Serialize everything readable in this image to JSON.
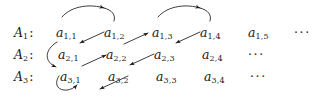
{
  "figure": {
    "ink_color": "#1a1a1a",
    "background_color": "#ffffff",
    "width": 325,
    "height": 100
  },
  "rows": [
    {
      "label_base": "A",
      "label_sub": "1",
      "label_punct": ":",
      "label_x": 14,
      "label_y": 27,
      "terms": [
        {
          "base": "a",
          "sub": "1,1",
          "x": 56,
          "y": 27
        },
        {
          "base": "a",
          "sub": "1,2",
          "x": 104,
          "y": 27
        },
        {
          "base": "a",
          "sub": "1,3",
          "x": 152,
          "y": 27
        },
        {
          "base": "a",
          "sub": "1,4",
          "x": 200,
          "y": 27
        },
        {
          "base": "a",
          "sub": "1,5",
          "x": 248,
          "y": 27
        }
      ],
      "ellipsis": {
        "text": "···",
        "x": 294,
        "y": 27
      }
    },
    {
      "label_base": "A",
      "label_sub": "2",
      "label_punct": ":",
      "label_x": 14,
      "label_y": 49,
      "terms": [
        {
          "base": "a",
          "sub": "2,1",
          "x": 58,
          "y": 49
        },
        {
          "base": "a",
          "sub": "2,2",
          "x": 106,
          "y": 49
        },
        {
          "base": "a",
          "sub": "2,3",
          "x": 154,
          "y": 49
        },
        {
          "base": "a",
          "sub": "2,4",
          "x": 202,
          "y": 49
        }
      ],
      "ellipsis": {
        "text": "···",
        "x": 248,
        "y": 49
      }
    },
    {
      "label_base": "A",
      "label_sub": "3",
      "label_punct": ":",
      "label_x": 14,
      "label_y": 71,
      "terms": [
        {
          "base": "a",
          "sub": "3,1",
          "x": 60,
          "y": 71
        },
        {
          "base": "a",
          "sub": "3,2",
          "x": 108,
          "y": 71
        },
        {
          "base": "a",
          "sub": "3,3",
          "x": 156,
          "y": 71
        },
        {
          "base": "a",
          "sub": "3,4",
          "x": 204,
          "y": 71
        }
      ],
      "ellipsis": {
        "text": "···",
        "x": 250,
        "y": 71
      }
    }
  ],
  "arrows": [
    {
      "id": "arc-a11-to-a12",
      "kind": "arc-over",
      "from": "a_1,1",
      "to": "a_1,2",
      "path": "M 62,17 C 72,5 98,4 110,16",
      "head_at": "apex"
    },
    {
      "id": "arc-a13-to-a14",
      "kind": "arc-over",
      "from": "a_1,3",
      "to": "a_1,4",
      "path": "M 158,17 C 168,5 194,4 206,16",
      "head_at": "apex"
    },
    {
      "id": "diag-a12-to-a21",
      "kind": "diagonal",
      "from": "a_1,2",
      "to": "a_2,1",
      "path": "M 104,32 L 76,44"
    },
    {
      "id": "diag-a22-to-a13",
      "kind": "diagonal",
      "from": "a_2,2",
      "to": "a_1,3",
      "path": "M 122,44 L 150,32"
    },
    {
      "id": "diag-a14-to-a23",
      "kind": "diagonal",
      "from": "a_1,4",
      "to": "a_2,3",
      "path": "M 200,32 L 172,44"
    },
    {
      "id": "curve-a21-to-a31",
      "kind": "arc-left",
      "from": "a_2,1",
      "to": "a_3,1",
      "path": "M 57,44 C 46,50 46,62 58,66"
    },
    {
      "id": "diag-a31-to-a22",
      "kind": "diagonal",
      "from": "a_3,1",
      "to": "a_2,2",
      "path": "M 80,66 L 108,54"
    },
    {
      "id": "diag-a23-to-a32",
      "kind": "diagonal",
      "from": "a_2,3",
      "to": "a_3,2",
      "path": "M 154,54 L 126,66"
    },
    {
      "id": "curve-a31-to-below",
      "kind": "arc-left",
      "from": "a_3,1",
      "to": "below-row-3",
      "path": "M 60,76 C 52,90 70,94 78,84"
    },
    {
      "id": "diag-a32-to-below",
      "kind": "diagonal",
      "from": "a_3,2",
      "to": "below-row-3",
      "path": "M 128,76 L 98,90"
    }
  ]
}
